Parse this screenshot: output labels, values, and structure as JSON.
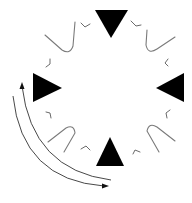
{
  "diagram": {
    "type": "rotational-symmetry-figure",
    "background": "#ffffff",
    "colors": {
      "triangle": "#000000",
      "hairpin": "#7a7a7a",
      "chevron": "#6a6a6a",
      "arrow": "#333333"
    },
    "triangles": [
      {
        "position": "top",
        "points": "95,10 128,10 111,38",
        "direction": "down"
      },
      {
        "position": "left",
        "points": "33,73 33,102 62,88",
        "direction": "right"
      },
      {
        "position": "right",
        "points": "184,73 184,102 156,88",
        "direction": "left"
      },
      {
        "position": "bottom",
        "points": "96,166 124,166 110,137",
        "direction": "up"
      }
    ],
    "hairpins": [
      {
        "position": "top-left",
        "path": "M45,35 L62,50 Q70,55 73,46 L75,22"
      },
      {
        "position": "top-right",
        "path": "M147,30 L146,45 Q148,55 157,49 L175,37"
      },
      {
        "position": "bottom-left",
        "path": "M48,142 L66,128 Q74,124 75,133 L64,152"
      },
      {
        "position": "bottom-right",
        "path": "M175,141 L157,127 Q149,122 147,131 L159,152"
      }
    ],
    "chevrons": [
      {
        "position": "top-left-inner",
        "path": "M81,23 L85,27 L90,24"
      },
      {
        "position": "top-right-inner",
        "path": "M131,21 L136,26 L141,25"
      },
      {
        "position": "left-upper",
        "path": "M50,59 L50,64 L46,67"
      },
      {
        "position": "right-upper",
        "path": "M168,59 L165,63 L168,66"
      },
      {
        "position": "left-lower",
        "path": "M46,112 L50,113 L51,118"
      },
      {
        "position": "right-lower",
        "path": "M170,110 L166,113 L167,118"
      },
      {
        "position": "bottom-left-inner",
        "path": "M81,149 L86,146 L90,150"
      },
      {
        "position": "bottom-right-inner",
        "path": "M133,154 L135,150 L140,152"
      }
    ],
    "arrows": [
      {
        "name": "inner-arc",
        "path": "M111,180 Q32,170 22,86",
        "head": "22,82 19.5,89 24.5,89",
        "direction": "counterclockwise"
      },
      {
        "name": "outer-arc",
        "path": "M13,96 Q22,180 104,186",
        "head": "109,186 102,183.5 102,188.5",
        "direction": "clockwise"
      }
    ]
  }
}
